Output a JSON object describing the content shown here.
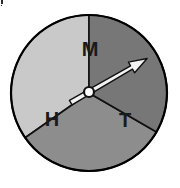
{
  "figure": {
    "title": "",
    "background_color": "#ffffff",
    "outline_color": "#000000",
    "width": 180,
    "height": 188
  },
  "dial": {
    "center_x": 89,
    "center_y": 93,
    "radius": 78,
    "outline_width": 2
  },
  "chart_data": {
    "type": "pie",
    "title": "",
    "xlabel": "",
    "ylabel": "",
    "legend": "inside-slices",
    "grid": false,
    "categories": [
      "H",
      "M",
      "T"
    ],
    "values": [
      35,
      32,
      33
    ],
    "units": "percent",
    "slices": [
      {
        "label": "H",
        "value": 35,
        "color": "#c9c9c9",
        "start_angle_deg": 90,
        "end_angle_deg": 215,
        "label_x": 52,
        "label_y": 121
      },
      {
        "label": "M",
        "value": 32,
        "color": "#8d8d8d",
        "start_angle_deg": 215,
        "end_angle_deg": 330,
        "label_x": 90,
        "label_y": 51
      },
      {
        "label": "T",
        "value": 33,
        "color": "#777777",
        "start_angle_deg": 330,
        "end_angle_deg": 450,
        "label_x": 125,
        "label_y": 122
      }
    ]
  },
  "needle": {
    "name": "pointer-needle",
    "angle_deg": 30,
    "points_to_slice": "M/T boundary",
    "fill_color": "#f2f2f2",
    "outline_color": "#111111",
    "tip_x": 148,
    "tip_y": 60,
    "tail_x": 71,
    "tail_y": 103
  },
  "hub": {
    "name": "needle-hub",
    "x": 89,
    "y": 92,
    "radius": 5,
    "fill_color": "#ffffff",
    "outline_color": "#111111"
  },
  "artifacts": [
    {
      "x": 1,
      "y": 0,
      "w": 2,
      "h": 4
    },
    {
      "x": 1,
      "y": 5,
      "w": 1,
      "h": 1
    }
  ]
}
